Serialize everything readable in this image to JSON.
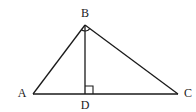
{
  "diagram": {
    "type": "geometry-triangle",
    "points": {
      "A": {
        "label": "A",
        "x": 33,
        "y": 94
      },
      "B": {
        "label": "B",
        "x": 85,
        "y": 25
      },
      "C": {
        "label": "C",
        "x": 178,
        "y": 94
      },
      "D": {
        "label": "D",
        "x": 85,
        "y": 94
      }
    },
    "segments": [
      "AB",
      "BC",
      "AC",
      "BD"
    ],
    "right_angles": [
      "ABC",
      "BDC"
    ],
    "stroke_color": "#1a1a1a",
    "background": "#ffffff"
  }
}
